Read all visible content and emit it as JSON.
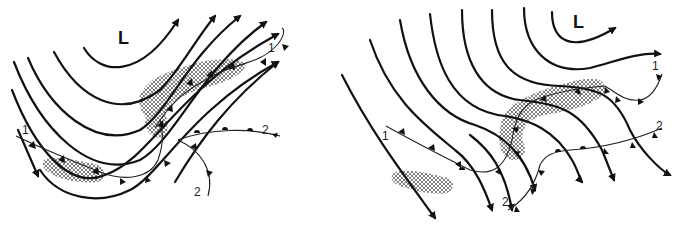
{
  "figure": {
    "colors": {
      "lines": "#111111",
      "background": "#ffffff",
      "hatch": "#555555"
    }
  },
  "panels": [
    {
      "id": "left",
      "low_label": "L",
      "front_labels": [
        "1",
        "1",
        "2",
        "2"
      ],
      "legend": {
        "streamlines": "arrows",
        "cold_front": "triangles",
        "warm_front": "semicircles",
        "precipitation": "cross-hatched areas"
      }
    },
    {
      "id": "right",
      "low_label": "L",
      "front_labels": [
        "1",
        "1",
        "2",
        "2"
      ]
    }
  ]
}
